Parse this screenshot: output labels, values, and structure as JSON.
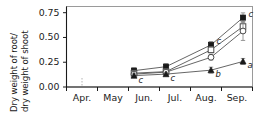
{
  "chart_data": {
    "type": "line",
    "title": "",
    "xlabel": "",
    "ylabel": "Dry weight of root/ dry weight of shoot",
    "ylabel_line1": "Dry weight of root/",
    "ylabel_line2": "dry weight of shoot",
    "ylim": [
      0.0,
      0.8125
    ],
    "yticks": [
      0.0,
      0.25,
      0.5,
      0.75
    ],
    "ytick_labels": [
      "0.00",
      "0.25",
      "0.50",
      "0.75"
    ],
    "xtick_labels": [
      "Apr.",
      "May",
      "Jun.",
      "Jul.",
      "Aug.",
      "Sep."
    ],
    "x_categories": [
      "Jun.",
      "Jul.",
      "Aug.",
      "Sep."
    ],
    "grid": false,
    "legend": "none",
    "series": [
      {
        "name": "filled-square",
        "marker": "filled-square",
        "values": [
          0.165,
          0.205,
          0.425,
          0.7
        ],
        "errors": [
          0.028,
          0.03,
          0.033,
          0.048
        ],
        "sig_labels": [
          "",
          "",
          "c",
          "c"
        ]
      },
      {
        "name": "open-square",
        "marker": "open-square",
        "values": [
          0.14,
          0.155,
          0.375,
          0.61
        ],
        "errors": [
          0.022,
          0.024,
          0.03,
          0.055
        ],
        "sig_labels": [
          "",
          "",
          "",
          ""
        ]
      },
      {
        "name": "open-circle",
        "marker": "open-circle",
        "values": [
          0.13,
          0.15,
          0.3,
          0.565
        ],
        "errors": [
          0.02,
          0.022,
          0.028,
          0.095
        ],
        "sig_labels": [
          "",
          "",
          "",
          ""
        ]
      },
      {
        "name": "filled-triangle",
        "marker": "filled-triangle",
        "values": [
          0.115,
          0.13,
          0.17,
          0.258
        ],
        "errors": [
          0.018,
          0.018,
          0.03,
          0.03
        ],
        "sig_labels": [
          "c",
          "c",
          "b",
          "a"
        ]
      }
    ],
    "annotations": [
      {
        "text": "c",
        "series": "filled-square",
        "point": 2
      },
      {
        "text": "c",
        "series": "filled-square",
        "point": 3
      },
      {
        "text": "c",
        "series": "filled-triangle",
        "point": 0
      },
      {
        "text": "c",
        "series": "filled-triangle",
        "point": 1
      },
      {
        "text": "b",
        "series": "filled-triangle",
        "point": 2
      },
      {
        "text": "a",
        "series": "filled-triangle",
        "point": 3
      }
    ],
    "colors": {
      "axis": "#1a1a1a",
      "marker_fill": "#1a1a1a",
      "marker_open": "#ffffff",
      "line": "#555555",
      "error_bar": "#8c8c8c"
    }
  }
}
